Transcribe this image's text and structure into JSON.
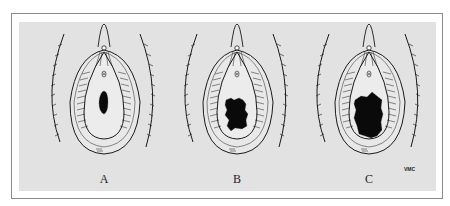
{
  "figure": {
    "panels": [
      {
        "label": "A",
        "lesion_size": "small"
      },
      {
        "label": "B",
        "lesion_size": "medium"
      },
      {
        "label": "C",
        "lesion_size": "large"
      }
    ],
    "signature": "VMC",
    "colors": {
      "background": "#e2e2e2",
      "ink": "#1a1a1a",
      "frame": "#8a8a8a"
    }
  }
}
